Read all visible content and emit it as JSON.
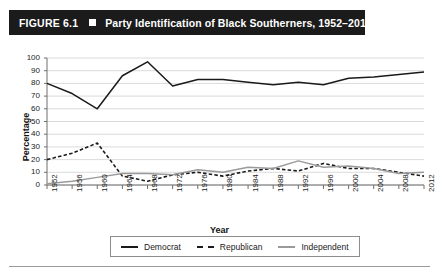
{
  "figure": {
    "number": "FIGURE 6.1",
    "title": "Party Identification of Black Southerners, 1952–2012",
    "marker_icon": "white-square-icon"
  },
  "chart_data": {
    "type": "line",
    "title": "Party Identification of Black Southerners, 1952–2012",
    "xlabel": "Year",
    "ylabel": "Percentage",
    "ylim": [
      0,
      100
    ],
    "ytick_step": 10,
    "yticks": [
      100,
      90,
      80,
      70,
      60,
      50,
      40,
      30,
      20,
      10,
      0
    ],
    "grid": "horizontal",
    "legend_position": "bottom-center",
    "categories": [
      "1952",
      "1956",
      "1960",
      "1964",
      "1968",
      "1972",
      "1976",
      "1980",
      "1984",
      "1988",
      "1992",
      "1996",
      "2000",
      "2004",
      "2008",
      "2012"
    ],
    "series": [
      {
        "name": "Democrat",
        "style": "solid",
        "color": "#1a1a1a",
        "values": [
          80,
          72,
          60,
          86,
          97,
          78,
          83,
          83,
          81,
          79,
          81,
          79,
          84,
          85,
          87,
          89
        ]
      },
      {
        "name": "Republican",
        "style": "dashed",
        "color": "#1a1a1a",
        "values": [
          20,
          25,
          33,
          7,
          3,
          8,
          10,
          7,
          11,
          13,
          11,
          17,
          13,
          13,
          10,
          7
        ]
      },
      {
        "name": "Independent",
        "style": "solid",
        "color": "#9a9a9a",
        "values": [
          1,
          3,
          6,
          9,
          9,
          8,
          12,
          10,
          14,
          13,
          19,
          14,
          15,
          13,
          9,
          10
        ]
      }
    ]
  },
  "colors": {
    "title_bar_background": "#1b1b1b",
    "title_text": "#ffffff",
    "democrat": "#1a1a1a",
    "republican": "#1a1a1a",
    "independent": "#9a9a9a",
    "gridline": "#d2d2d2",
    "axis": "#6e6e6e"
  }
}
